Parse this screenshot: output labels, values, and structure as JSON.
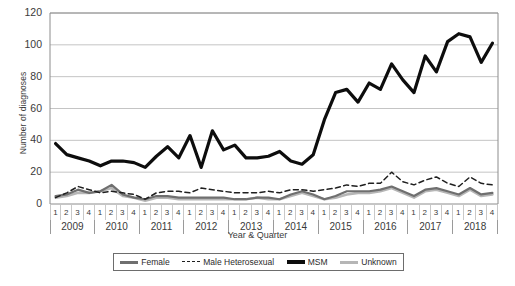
{
  "chart_data": {
    "type": "line",
    "title": "",
    "xlabel": "Year & Quarter",
    "ylabel": "Number of diagnoses",
    "ylim": [
      0,
      120
    ],
    "ytick_step": 20,
    "yticks": [
      "0",
      "20",
      "40",
      "60",
      "80",
      "100",
      "120"
    ],
    "grid": "horizontal",
    "legend_position": "bottom",
    "years": [
      "2009",
      "2010",
      "2011",
      "2012",
      "2013",
      "2014",
      "2015",
      "2016",
      "2017",
      "2018"
    ],
    "quarters": [
      "1",
      "2",
      "3",
      "4"
    ],
    "x": [
      "2009 Q1",
      "2009 Q2",
      "2009 Q3",
      "2009 Q4",
      "2010 Q1",
      "2010 Q2",
      "2010 Q3",
      "2010 Q4",
      "2011 Q1",
      "2011 Q2",
      "2011 Q3",
      "2011 Q4",
      "2012 Q1",
      "2012 Q2",
      "2012 Q3",
      "2012 Q4",
      "2013 Q1",
      "2013 Q2",
      "2013 Q3",
      "2013 Q4",
      "2014 Q1",
      "2014 Q2",
      "2014 Q3",
      "2014 Q4",
      "2015 Q1",
      "2015 Q2",
      "2015 Q3",
      "2015 Q4",
      "2016 Q1",
      "2016 Q2",
      "2016 Q3",
      "2016 Q4",
      "2017 Q1",
      "2017 Q2",
      "2017 Q3",
      "2017 Q4",
      "2018 Q1",
      "2018 Q2",
      "2018 Q3",
      "2018 Q4"
    ],
    "series": [
      {
        "name": "Female",
        "color": "#6f6f6f",
        "style": "solid",
        "width": 2.2,
        "values": [
          5,
          6,
          9,
          7,
          8,
          12,
          6,
          4,
          3,
          5,
          5,
          4,
          4,
          4,
          4,
          4,
          3,
          3,
          4,
          4,
          3,
          6,
          8,
          6,
          3,
          5,
          8,
          8,
          8,
          9,
          11,
          8,
          5,
          9,
          10,
          8,
          6,
          10,
          6,
          7
        ]
      },
      {
        "name": "Male Heterosexual",
        "color": "#1f1f1f",
        "style": "dashed",
        "width": 1.5,
        "values": [
          4,
          7,
          11,
          9,
          7,
          8,
          7,
          6,
          3,
          7,
          8,
          8,
          7,
          10,
          9,
          8,
          7,
          7,
          7,
          8,
          7,
          9,
          9,
          8,
          9,
          10,
          12,
          11,
          13,
          13,
          20,
          14,
          12,
          15,
          17,
          13,
          11,
          17,
          13,
          12
        ]
      },
      {
        "name": "MSM",
        "color": "#0d0d0d",
        "style": "solid",
        "width": 3.2,
        "values": [
          38,
          31,
          29,
          27,
          24,
          27,
          27,
          26,
          23,
          30,
          36,
          29,
          43,
          23,
          46,
          34,
          37,
          29,
          29,
          30,
          33,
          27,
          25,
          31,
          53,
          70,
          72,
          64,
          76,
          72,
          88,
          78,
          70,
          93,
          83,
          102,
          107,
          105,
          89,
          101
        ]
      },
      {
        "name": "Unknown",
        "color": "#b6b6b6",
        "style": "solid",
        "width": 2.6,
        "values": [
          4,
          5,
          7,
          7,
          8,
          10,
          5,
          4,
          2,
          4,
          4,
          3,
          3,
          3,
          3,
          3,
          3,
          3,
          4,
          3,
          3,
          5,
          7,
          5,
          3,
          4,
          6,
          7,
          7,
          8,
          10,
          7,
          4,
          8,
          9,
          7,
          5,
          9,
          5,
          6
        ]
      }
    ]
  },
  "axis": {
    "ylabel": "Number of diagnoses",
    "xlabel": "Year & Quarter"
  },
  "legend": {
    "items": [
      {
        "label": "Female"
      },
      {
        "label": "Male Heterosexual"
      },
      {
        "label": "MSM"
      },
      {
        "label": "Unknown"
      }
    ]
  }
}
